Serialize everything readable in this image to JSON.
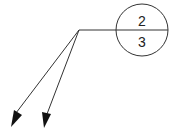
{
  "balloon": {
    "top_value": "2",
    "bottom_value": "3"
  },
  "colors": {
    "line": "#333333",
    "background": "#ffffff"
  }
}
